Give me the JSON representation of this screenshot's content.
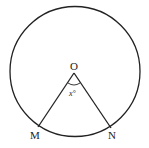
{
  "diagram": {
    "center_label": "O",
    "point_labels": [
      "M",
      "N"
    ],
    "angle_label": "x°",
    "colors": {
      "stroke": "#222222",
      "background": "#ffffff"
    }
  }
}
